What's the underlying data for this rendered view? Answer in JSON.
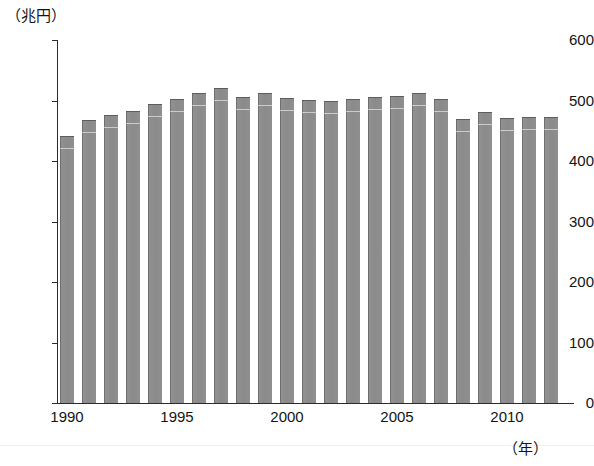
{
  "chart_data": {
    "type": "bar",
    "title": "",
    "subtitle": "",
    "xlabel": "(年)",
    "ylabel": "(兆円)",
    "ylim": [
      0,
      600
    ],
    "yticks": [
      0,
      100,
      200,
      300,
      400,
      500,
      600
    ],
    "ytick_labels": [
      "0",
      "100",
      "200",
      "300",
      "400",
      "500",
      "600"
    ],
    "xticks": [
      1990,
      1995,
      2000,
      2005,
      2010
    ],
    "xtick_labels": [
      "1990",
      "1995",
      "2000",
      "2005",
      "2010"
    ],
    "grid": false,
    "legend": null,
    "bar_color": "#8c8c8c",
    "axis_color": "#2b2b2b",
    "categories": [
      "1990",
      "1991",
      "1992",
      "1993",
      "1994",
      "1995",
      "1996",
      "1997",
      "1998",
      "1999",
      "2000",
      "2001",
      "2002",
      "2003",
      "2004",
      "2005",
      "2006",
      "2007",
      "2008",
      "2009",
      "2010",
      "2011",
      "2012"
    ],
    "values": [
      441,
      468,
      476,
      482,
      495,
      502,
      513,
      521,
      505,
      512,
      504,
      501,
      500,
      502,
      506,
      508,
      513,
      502,
      470,
      481,
      471,
      473,
      473
    ]
  },
  "axis": {
    "y_unit": "（兆円）",
    "x_unit": "（年）"
  }
}
